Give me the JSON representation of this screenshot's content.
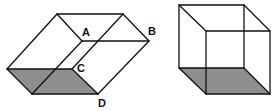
{
  "figure": {
    "shade_color": "#8e8e8e",
    "line_color": "#111111",
    "left_solid": {
      "labels": {
        "A": "A",
        "B": "B",
        "C": "C",
        "D": "D"
      }
    },
    "right_cube": {
      "labels": {}
    }
  }
}
